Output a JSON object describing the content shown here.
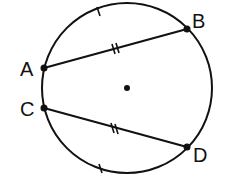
{
  "diagram": {
    "type": "circle-geometry",
    "circle": {
      "center": [
        127,
        88
      ],
      "radius": 85,
      "center_marked": true
    },
    "points": [
      {
        "id": "A",
        "label": "A",
        "x": 44,
        "y": 68,
        "lx": 20,
        "ly": 76
      },
      {
        "id": "B",
        "label": "B",
        "x": 187,
        "y": 29,
        "lx": 192,
        "ly": 28
      },
      {
        "id": "C",
        "label": "C",
        "x": 44,
        "y": 108,
        "lx": 20,
        "ly": 116
      },
      {
        "id": "D",
        "label": "D",
        "x": 187,
        "y": 147,
        "lx": 193,
        "ly": 162
      }
    ],
    "chords": [
      {
        "from": "A",
        "to": "B",
        "tick_marks": 2
      },
      {
        "from": "C",
        "to": "D",
        "tick_marks": 2
      }
    ],
    "arc_ticks": [
      {
        "arc": "AB",
        "tick_marks": 1
      },
      {
        "arc": "CD",
        "tick_marks": 1
      }
    ],
    "color": "#111111"
  }
}
